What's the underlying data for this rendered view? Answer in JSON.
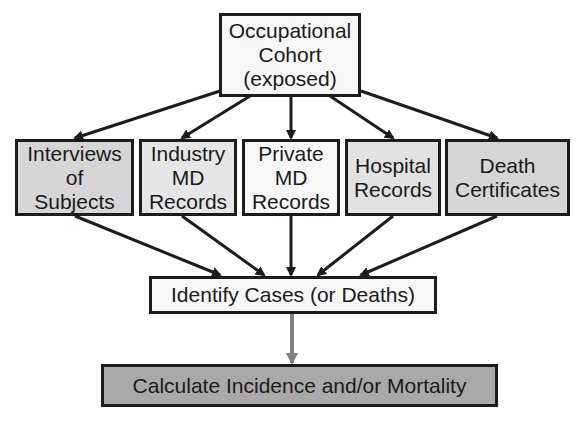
{
  "diagram": {
    "type": "flowchart",
    "colors": {
      "border": "#1c1c1c",
      "white_fill": "#f7f7f7",
      "light_fill": "#e6e6e6",
      "medium_fill": "#d6d6d6",
      "dark_fill": "#a9a9a9",
      "gray_arrow": "#808080"
    },
    "top": {
      "label": "Occupational\nCohort\n(exposed)"
    },
    "sources": [
      {
        "label": "Interviews\nof\nSubjects"
      },
      {
        "label": "Industry\nMD\nRecords"
      },
      {
        "label": "Private\nMD\nRecords"
      },
      {
        "label": "Hospital\nRecords"
      },
      {
        "label": "Death\nCertificates"
      }
    ],
    "identify": {
      "label": "Identify Cases (or Deaths)"
    },
    "calculate": {
      "label": "Calculate Incidence and/or Mortality"
    }
  }
}
